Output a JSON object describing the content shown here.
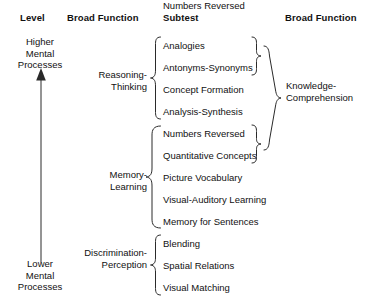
{
  "headers": {
    "level": "Level",
    "broad_function_left": "Broad Function",
    "subtest": "Subtest",
    "broad_function_right": "Broad Function"
  },
  "level_axis": {
    "top_label_line1": "Higher",
    "top_label_line2": "Mental",
    "top_label_line3": "Processes",
    "bottom_label_line1": "Lower",
    "bottom_label_line2": "Mental",
    "bottom_label_line3": "Processes",
    "arrow_direction": "up"
  },
  "broad_functions_left": [
    {
      "line1": "Reasoning-",
      "line2": "Thinking",
      "subtest_count": 4
    },
    {
      "line1": "Memory-",
      "line2": "Learning",
      "subtest_count": 5
    },
    {
      "line1": "Discrimination-",
      "line2": "Perception",
      "subtest_count": 3
    }
  ],
  "subtests": [
    {
      "label": "Analogies"
    },
    {
      "label": "Antonyms-Synonyms"
    },
    {
      "label": "Concept Formation"
    },
    {
      "label": "Analysis-Synthesis"
    },
    {
      "label": "Numbers Reversed"
    },
    {
      "label": "Quantitative Concepts"
    },
    {
      "label": "Picture Vocabulary"
    },
    {
      "label": "Visual-Auditory Learning"
    },
    {
      "label": "Memory for Sentences"
    },
    {
      "label": "Blending"
    },
    {
      "label": "Spatial Relations"
    },
    {
      "label": "Visual Matching"
    }
  ],
  "broad_function_right": {
    "line1": "Knowledge-",
    "line2": "Comprehension",
    "grouped_subtests": [
      "Analogies",
      "Antonyms-Synonyms",
      "Numbers Reversed",
      "Quantitative Concepts"
    ]
  },
  "colors": {
    "background": "#ffffff",
    "text": "#111111",
    "stroke": "#2a2a2a"
  }
}
